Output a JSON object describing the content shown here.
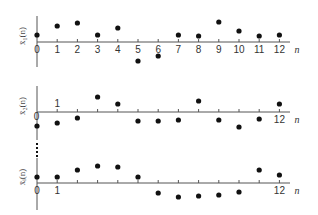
{
  "chart_data": {
    "type": "scatter",
    "subtype": "stem-dots (discrete-time sequences)",
    "x": [
      0,
      1,
      2,
      3,
      4,
      5,
      6,
      7,
      8,
      9,
      10,
      11,
      12
    ],
    "xlabel": "n",
    "grid": false,
    "legend": null,
    "panels": [
      {
        "name": "x1",
        "ylabel": "x̄₁(n)",
        "x_tick_labels": [
          "0",
          "1",
          "2",
          "3",
          "4",
          "5",
          "6",
          "7",
          "8",
          "9",
          "10",
          "11",
          "12"
        ],
        "x_tick_label_position": "below",
        "values": [
          0.7,
          1.6,
          1.9,
          0.7,
          1.4,
          -1.9,
          -1.4,
          0.7,
          0.6,
          2.0,
          1.1,
          0.6,
          0.7
        ]
      },
      {
        "name": "x2",
        "ylabel": "x̄₂(n)",
        "x_tick_labels_shown": [
          {
            "n": 0,
            "label": "0",
            "position": "left-below"
          },
          {
            "n": 1,
            "label": "1",
            "position": "above"
          },
          {
            "n": 12,
            "label": "12",
            "position": "below"
          }
        ],
        "values": [
          -1.4,
          -1.1,
          -0.6,
          1.5,
          0.8,
          -0.9,
          -0.9,
          -0.8,
          1.1,
          -0.8,
          -1.5,
          -0.7,
          0.8
        ]
      },
      {
        "name": "xi",
        "ylabel": "x̄ᵢ(n)",
        "x_tick_labels_shown": [
          {
            "n": 0,
            "label": "0",
            "position": "below"
          },
          {
            "n": 1,
            "label": "1",
            "position": "below"
          },
          {
            "n": 12,
            "label": "12",
            "position": "below"
          }
        ],
        "values": [
          0.6,
          0.6,
          1.3,
          1.7,
          1.6,
          0.6,
          -1.0,
          -1.4,
          -1.3,
          -1.2,
          -0.9,
          1.3,
          0.8
        ]
      }
    ],
    "annotations": [
      "vertical dots (⋮) between panel 2 and panel 3 indicating continuation of ensemble members"
    ]
  },
  "colors": {
    "dot": "#111111",
    "axis": "#555555",
    "text": "#333333"
  },
  "layout": {
    "x0": 37,
    "dx": 20.2,
    "scale": 10,
    "panels": [
      {
        "axis_y": 42,
        "yaxis_top": 16,
        "yaxis_bottom": 67
      },
      {
        "axis_y": 112,
        "yaxis_top": 86,
        "yaxis_bottom": 140
      },
      {
        "axis_y": 183,
        "yaxis_top": 158,
        "yaxis_bottom": 210
      }
    ],
    "axis_right": 290
  }
}
